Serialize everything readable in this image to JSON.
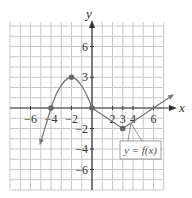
{
  "chart_data": {
    "type": "line",
    "title": "",
    "xlabel": "x",
    "ylabel": "y",
    "xlim": [
      -8,
      7
    ],
    "ylim": [
      -8,
      8
    ],
    "grid": true,
    "x_ticks": [
      -6,
      -4,
      -2,
      2,
      3,
      4,
      6
    ],
    "x_tick_labels": [
      "−6",
      "−4",
      "−2",
      "2",
      "3",
      "4",
      "6"
    ],
    "y_ticks": [
      6,
      3,
      -2,
      -4,
      -6
    ],
    "y_tick_labels": [
      "6",
      "3",
      "−2",
      "−4",
      "−6"
    ],
    "series": [
      {
        "name": "y = f(x)",
        "points": [
          {
            "x": -5,
            "y": -3.3
          },
          {
            "x": -4,
            "y": 0
          },
          {
            "x": -2,
            "y": 3
          },
          {
            "x": 0,
            "y": 0
          },
          {
            "x": 3,
            "y": -2
          },
          {
            "x": 7.8,
            "y": 1.2
          }
        ],
        "marked_points": [
          {
            "x": -4,
            "y": 0
          },
          {
            "x": -2,
            "y": 3
          },
          {
            "x": 0,
            "y": 0
          },
          {
            "x": 3,
            "y": -2
          }
        ],
        "arrow_ends": [
          "left",
          "right"
        ]
      }
    ],
    "annotations": [
      {
        "text": "y = f(x)",
        "type": "callout-box",
        "points_to": {
          "x": 3.8,
          "y": -1.6
        }
      }
    ],
    "colors": {
      "curve": "#777777",
      "grid": "#c8c8c8",
      "axes": "#333333",
      "points": "#666666"
    }
  },
  "labels": {
    "x_axis": "x",
    "y_axis": "y",
    "function": "y = f(x)"
  }
}
